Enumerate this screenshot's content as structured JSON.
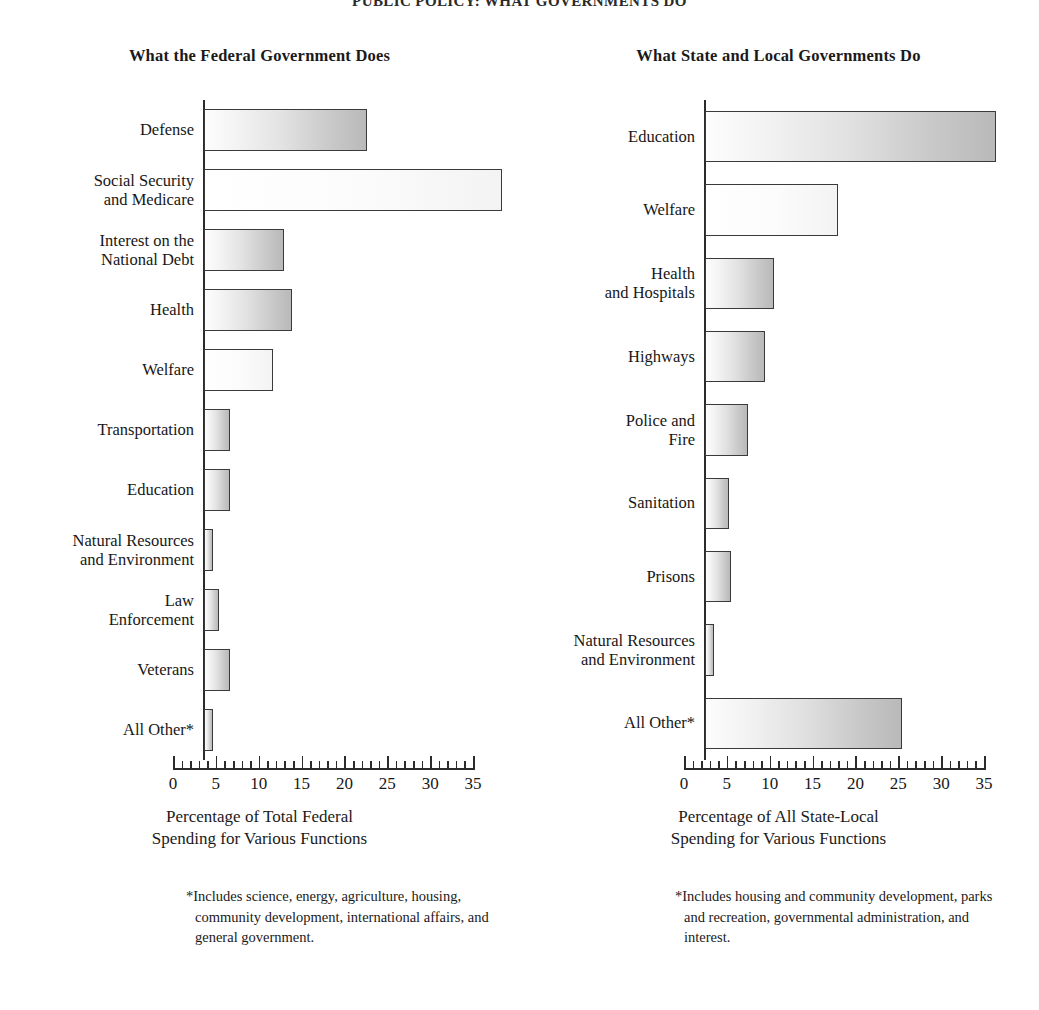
{
  "page_header": "PUBLIC POLICY: WHAT GOVERNMENTS DO",
  "charts": [
    {
      "title": "What the Federal Government Does",
      "axis_caption": "Percentage of Total Federal\nSpending for Various Functions",
      "footnote": "*Includes science, energy, agriculture, housing, community development, international affairs, and general government."
    },
    {
      "title": "What State and Local Governments Do",
      "axis_caption": "Percentage of All State-Local\nSpending for Various Functions",
      "footnote": "*Includes housing and community development, parks and recreation, governmental administration, and interest."
    }
  ],
  "chart_data": [
    {
      "type": "bar",
      "orientation": "horizontal",
      "title": "What the Federal Government Does",
      "xlabel": "Percentage of Total Federal Spending for Various Functions",
      "ylabel": "",
      "xlim": [
        0,
        35
      ],
      "xticks": [
        0,
        5,
        10,
        15,
        20,
        25,
        30,
        35
      ],
      "minor_tick_step": 1,
      "grid": false,
      "legend": "none",
      "categories": [
        "Defense",
        "Social Security\nand Medicare",
        "Interest on the\nNational Debt",
        "Health",
        "Welfare",
        "Transportation",
        "Education",
        "Natural Resources\nand Environment",
        "Law\nEnforcement",
        "Veterans",
        "All Other*"
      ],
      "values": [
        19,
        34.8,
        9.3,
        10.3,
        8,
        3,
        3,
        1,
        1.7,
        3,
        1
      ]
    },
    {
      "type": "bar",
      "orientation": "horizontal",
      "title": "What State and Local Governments Do",
      "xlabel": "Percentage of All State-Local Spending for Various Functions",
      "ylabel": "",
      "xlim": [
        0,
        35
      ],
      "xticks": [
        0,
        5,
        10,
        15,
        20,
        25,
        30,
        35
      ],
      "minor_tick_step": 1,
      "grid": false,
      "legend": "none",
      "categories": [
        "Education",
        "Welfare",
        "Health\nand Hospitals",
        "Highways",
        "Police and\nFire",
        "Sanitation",
        "Prisons",
        "Natural Resources\nand Environment",
        "All Other*"
      ],
      "values": [
        34,
        15.5,
        8,
        7,
        5,
        2.8,
        3,
        1.1,
        23
      ]
    }
  ],
  "style": {
    "bar_border": "#3a3a3a",
    "axis_color": "#2b2b2b",
    "text_color": "#171717",
    "background": "#ffffff"
  }
}
